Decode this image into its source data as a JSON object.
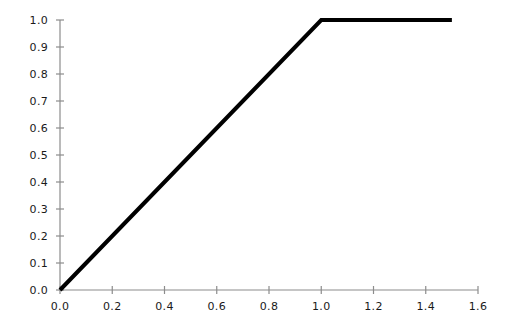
{
  "chart_data": {
    "type": "line",
    "title": "",
    "subtitle": "",
    "xlabel": "",
    "ylabel": "",
    "xlim": [
      0.0,
      1.6
    ],
    "ylim": [
      0.0,
      1.0
    ],
    "grid": false,
    "legend": false,
    "legend_position": "none",
    "xticks": [
      0.0,
      0.2,
      0.4,
      0.6,
      0.8,
      1.0,
      1.2,
      1.4,
      1.6
    ],
    "xtick_labels": [
      "0.0",
      "0.2",
      "0.4",
      "0.6",
      "0.8",
      "1.0",
      "1.2",
      "1.4",
      "1.6"
    ],
    "yticks": [
      0.0,
      0.1,
      0.2,
      0.3,
      0.4,
      0.5,
      0.6,
      0.7,
      0.8,
      0.9,
      1.0
    ],
    "ytick_labels": [
      "0.0",
      "0.1",
      "0.2",
      "0.3",
      "0.4",
      "0.5",
      "0.6",
      "0.7",
      "0.8",
      "0.9",
      "1.0"
    ],
    "series": [
      {
        "name": "clipped-ramp",
        "color": "#000000",
        "linewidth": 4,
        "x": [
          0.0,
          1.0,
          1.5
        ],
        "y": [
          0.0,
          1.0,
          1.0
        ]
      }
    ],
    "annotations": [],
    "axis_color": "#8c8c8c",
    "spines": [
      "left",
      "bottom"
    ]
  }
}
